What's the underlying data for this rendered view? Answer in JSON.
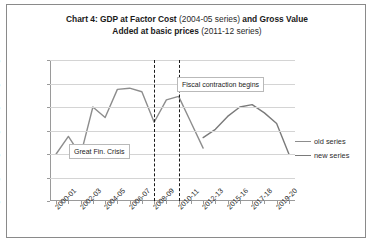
{
  "title": {
    "part1_bold": "Chart 4: GDP at Factor Cost ",
    "part2_normal": "(2004-05 series) ",
    "part3_bold": "and Gross Value",
    "line2_bold": "Added at basic prices ",
    "line2_normal": "(2011-12 series)"
  },
  "legend": {
    "position": "right",
    "items": [
      {
        "label": "old series",
        "color": "#8d8d8d"
      },
      {
        "label": "new series",
        "color": "#7a7a7a"
      }
    ]
  },
  "annotations": [
    {
      "id": "great-fin-crisis",
      "text": "Great Fin. Crisis"
    },
    {
      "id": "fiscal-contraction",
      "text": "Fiscal contraction begins"
    }
  ],
  "chart_data": {
    "type": "line",
    "title": "Chart 4: GDP at Factor Cost (2004-05 series) and Gross Value Added at basic prices (2011-12 series)",
    "xlabel": "",
    "ylabel": "",
    "ylim": [
      0,
      12
    ],
    "ytick_values": [
      0,
      2,
      4,
      6,
      8,
      10,
      12
    ],
    "ytick_labels": [
      "0.0%",
      "2.0%",
      "4.0%",
      "6.0%",
      "8.0%",
      "10.0%",
      "12.0%"
    ],
    "grid": true,
    "x": [
      "2000-01",
      "2001-02",
      "2002-03",
      "2003-04",
      "2004-05",
      "2005-06",
      "2006-07",
      "2007-08",
      "2008-09",
      "2009-10",
      "2010-11",
      "2011-12",
      "2012-13",
      "2013-14",
      "2014-15",
      "2015-16",
      "2016-17",
      "2017-18",
      "2018-19",
      "2019-20"
    ],
    "xtick_labels": [
      "2000-01",
      "2002-03",
      "2004-05",
      "2006-07",
      "2008-09",
      "2010-11",
      "2012-13",
      "2015-16",
      "2017-18",
      "2019-20"
    ],
    "xtick_label_indices": [
      0,
      2,
      4,
      6,
      8,
      10,
      12,
      14,
      16,
      18
    ],
    "series": [
      {
        "name": "old series",
        "color": "#8d8d8d",
        "values": [
          4.0,
          5.5,
          3.9,
          8.0,
          7.1,
          9.5,
          9.6,
          9.3,
          6.7,
          8.6,
          8.9,
          6.7,
          4.5,
          null,
          null,
          null,
          null,
          null,
          null,
          null
        ]
      },
      {
        "name": "new series",
        "color": "#7a7a7a",
        "values": [
          null,
          null,
          null,
          null,
          null,
          null,
          null,
          null,
          null,
          null,
          null,
          null,
          5.4,
          6.1,
          7.2,
          8.0,
          8.2,
          7.5,
          6.6,
          4.0
        ]
      }
    ],
    "vlines": [
      {
        "label": "Great Fin. Crisis",
        "x": "2008-09"
      },
      {
        "label": "Fiscal contraction begins",
        "x": "2010-11"
      }
    ]
  }
}
